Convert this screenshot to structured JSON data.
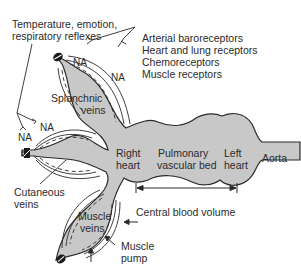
{
  "diagram": {
    "top_left_label": [
      "Temperature, emotion,",
      "respiratory reflexes"
    ],
    "receptors": [
      "Arterial baroreceptors",
      "Heart and lung receptors",
      "Chemoreceptors",
      "Muscle receptors"
    ],
    "nerve_label": "NA",
    "compartments": {
      "splanchnic": [
        "Splanchnic",
        "veins"
      ],
      "cutaneous": [
        "Cutaneous",
        "veins"
      ],
      "muscle": [
        "Muscle",
        "veins"
      ],
      "right_heart": [
        "Right",
        "heart"
      ],
      "pulmonary": [
        "Pulmonary",
        "vascular bed"
      ],
      "left_heart": [
        "Left",
        "heart"
      ],
      "aorta": "Aorta"
    },
    "central_blood_volume": "Central blood volume",
    "muscle_pump": [
      "Muscle",
      "pump"
    ],
    "colors": {
      "fill": "#c8c8c8",
      "stroke": "#2a2a2a",
      "text": "#2b2b2b"
    }
  }
}
